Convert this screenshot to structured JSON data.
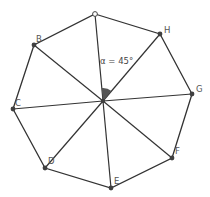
{
  "diagram": {
    "center": {
      "x": 103,
      "y": 101
    },
    "vertices": [
      {
        "name": "",
        "x": 95,
        "y": 14,
        "open": true
      },
      {
        "name": "H",
        "x": 160,
        "y": 34
      },
      {
        "name": "G",
        "x": 192,
        "y": 94
      },
      {
        "name": "F",
        "x": 172,
        "y": 158
      },
      {
        "name": "E",
        "x": 111,
        "y": 188
      },
      {
        "name": "D",
        "x": 45,
        "y": 168
      },
      {
        "name": "C",
        "x": 13,
        "y": 109
      },
      {
        "name": "B",
        "x": 34,
        "y": 45
      }
    ],
    "angle": {
      "label": "α = 45°",
      "symbol": "α",
      "value_degrees": 45,
      "between": [
        "top",
        "H"
      ]
    },
    "colors": {
      "line": "#333333",
      "point": "#404040",
      "sector": "#555555"
    }
  }
}
